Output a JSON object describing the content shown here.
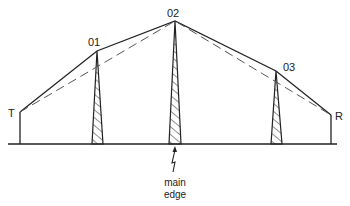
{
  "diagram": {
    "type": "multiple knife-edge diffraction profile",
    "colors": {
      "line": "#222222",
      "dashed": "#555555",
      "background": "#ffffff"
    },
    "terminals": {
      "transmitter": {
        "label": "T",
        "x": 20,
        "top": 112
      },
      "receiver": {
        "label": "R",
        "x": 331,
        "top": 115
      }
    },
    "obstacles": [
      {
        "label": "01",
        "x": 97,
        "top": 51
      },
      {
        "label": "02",
        "x": 175,
        "top": 21
      },
      {
        "label": "03",
        "x": 276,
        "top": 71
      }
    ],
    "ground_y": 144,
    "annotation": {
      "line1": "main",
      "line2": "edge"
    }
  }
}
